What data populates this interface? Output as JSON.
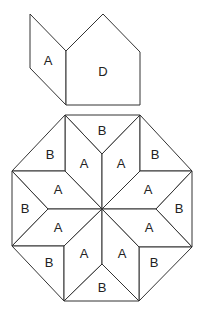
{
  "diagram": {
    "stroke_color": "#333333",
    "fill_color": "#ffffff",
    "top_pieces": [
      {
        "label": "A",
        "shape": "rhombus",
        "points": "30,14 66,51 66,105 30,68",
        "lx": 48,
        "ly": 60
      },
      {
        "label": "D",
        "shape": "pentagon",
        "points": "66,51 103,14 140,52 140,105 66,105",
        "lx": 103,
        "ly": 71
      }
    ],
    "octagon_pieces": [
      {
        "label": "B",
        "shape": "triangle",
        "points": "65,115 140,115 102,154",
        "lx": 102,
        "ly": 130
      },
      {
        "label": "A",
        "shape": "rhombus",
        "points": "102,209 102,154 65,115 65,171",
        "lx": 84,
        "ly": 163
      },
      {
        "label": "A",
        "shape": "rhombus",
        "points": "102,209 102,154 140,115 140,171",
        "lx": 121,
        "ly": 163
      },
      {
        "label": "B",
        "shape": "triangle",
        "points": "65,115 12,171 65,171",
        "lx": 50,
        "ly": 154
      },
      {
        "label": "B",
        "shape": "triangle",
        "points": "140,115 192,171 140,171",
        "lx": 155,
        "ly": 154
      },
      {
        "label": "A",
        "shape": "rhombus",
        "points": "102,209 65,171 12,171 48,209",
        "lx": 58,
        "ly": 189
      },
      {
        "label": "A",
        "shape": "rhombus",
        "points": "102,209 140,171 192,171 156,209",
        "lx": 148,
        "ly": 189
      },
      {
        "label": "B",
        "shape": "triangle",
        "points": "12,171 12,246 48,209",
        "lx": 25,
        "ly": 208
      },
      {
        "label": "B",
        "shape": "triangle",
        "points": "192,171 192,247 156,209",
        "lx": 179,
        "ly": 208
      },
      {
        "label": "A",
        "shape": "rhombus",
        "points": "102,209 48,209 12,246 64,246",
        "lx": 58,
        "ly": 227
      },
      {
        "label": "A",
        "shape": "rhombus",
        "points": "102,209 156,209 192,247 139,247",
        "lx": 149,
        "ly": 227
      },
      {
        "label": "B",
        "shape": "triangle",
        "points": "12,246 64,246 64,301",
        "lx": 49,
        "ly": 262
      },
      {
        "label": "B",
        "shape": "triangle",
        "points": "192,247 139,247 139,301",
        "lx": 154,
        "ly": 262
      },
      {
        "label": "A",
        "shape": "rhombus",
        "points": "102,209 64,246 64,301 102,264",
        "lx": 84,
        "ly": 253
      },
      {
        "label": "A",
        "shape": "rhombus",
        "points": "102,209 139,247 139,301 102,264",
        "lx": 122,
        "ly": 253
      },
      {
        "label": "B",
        "shape": "triangle",
        "points": "64,301 139,301 102,264",
        "lx": 102,
        "ly": 287
      }
    ]
  }
}
